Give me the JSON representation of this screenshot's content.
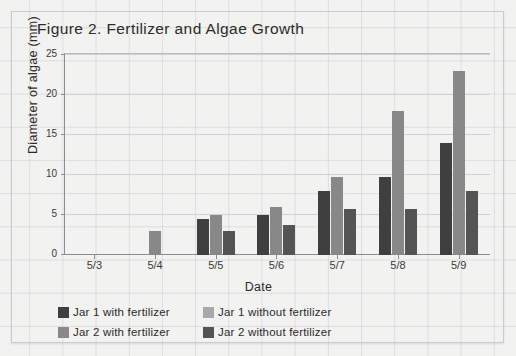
{
  "top_strip_text": "",
  "figure": {
    "title": "Figure 2. Fertilizer and Algae Growth"
  },
  "axes": {
    "y_title": "Diameter of algae (mm)",
    "x_title": "Date",
    "y_ticks": [
      "0",
      "5",
      "10",
      "15",
      "20",
      "25"
    ],
    "x_ticks": [
      "5/3",
      "5/4",
      "5/5",
      "5/6",
      "5/7",
      "5/8",
      "5/9"
    ]
  },
  "legend": {
    "items": [
      {
        "label": "Jar 1 with fertilizer",
        "color": "#3f3f3f"
      },
      {
        "label": "Jar 1 without fertilizer",
        "color": "#a8a8a8"
      },
      {
        "label": "Jar 2 with fertilizer",
        "color": "#888888"
      },
      {
        "label": "Jar 2 without fertilizer",
        "color": "#545454"
      }
    ]
  },
  "chart_data": {
    "type": "bar",
    "title": "Figure 2. Fertilizer and Algae Growth",
    "xlabel": "Date",
    "ylabel": "Diameter of algae (mm)",
    "categories": [
      "5/3",
      "5/4",
      "5/5",
      "5/6",
      "5/7",
      "5/8",
      "5/9"
    ],
    "ylim": [
      0,
      25
    ],
    "yticks": [
      0,
      5,
      10,
      15,
      20,
      25
    ],
    "grid": true,
    "legend_position": "below-plot",
    "series": [
      {
        "name": "Jar 1 with fertilizer",
        "color": "#3f3f3f",
        "values": [
          0,
          0,
          4.5,
          5.0,
          8.0,
          9.7,
          14.0
        ]
      },
      {
        "name": "Jar 1 without fertilizer",
        "color": "#a8a8a8",
        "values": [
          0,
          0,
          0,
          0,
          0,
          0,
          0
        ]
      },
      {
        "name": "Jar 2 with fertilizer",
        "color": "#888888",
        "values": [
          0,
          3.0,
          5.0,
          6.0,
          9.7,
          18.0,
          23.0
        ]
      },
      {
        "name": "Jar 2 without fertilizer",
        "color": "#545454",
        "values": [
          0,
          0,
          3.0,
          3.7,
          5.7,
          5.7,
          8.0
        ]
      }
    ]
  }
}
